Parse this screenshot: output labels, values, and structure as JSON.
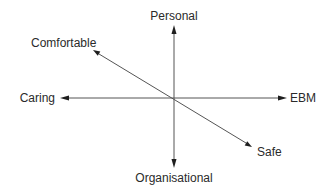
{
  "diagram": {
    "type": "bipolar-axes",
    "center": "origin",
    "axes": [
      {
        "name": "vertical",
        "positive_label": "Personal",
        "negative_label": "Organisational"
      },
      {
        "name": "horizontal",
        "positive_label": "EBM",
        "negative_label": "Caring"
      },
      {
        "name": "diagonal",
        "positive_label": "Safe",
        "negative_label": "Comfortable"
      }
    ],
    "labels": {
      "personal": "Personal",
      "organisational": "Organisational",
      "caring": "Caring",
      "ebm": "EBM",
      "comfortable": "Comfortable",
      "safe": "Safe"
    },
    "colors": {
      "line": "#555555",
      "arrow": "#1e1e1e",
      "text": "#2a2a2a",
      "background": "#ffffff"
    }
  }
}
